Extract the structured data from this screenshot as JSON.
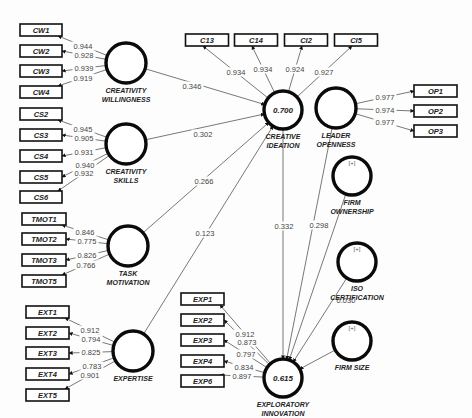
{
  "diagram": {
    "type": "PLS-SEM path model",
    "colors": {
      "stroke": "#0a0a0a",
      "edge": "#555555",
      "text": "#222222",
      "background": "#fdfdfd"
    },
    "latents": [
      {
        "id": "CW",
        "label_lines": [
          "CREATIVITY",
          "WILLINGNESS"
        ],
        "cx": 126,
        "cy": 63,
        "r": 20,
        "r2": "",
        "formative": false
      },
      {
        "id": "CS",
        "label_lines": [
          "CREATIVITY",
          "SKILLS"
        ],
        "cx": 126,
        "cy": 144,
        "r": 20,
        "r2": "",
        "formative": false
      },
      {
        "id": "TMOT",
        "label_lines": [
          "TASK",
          "MOTIVATION"
        ],
        "cx": 128,
        "cy": 246,
        "r": 20,
        "r2": "",
        "formative": false
      },
      {
        "id": "EXT",
        "label_lines": [
          "EXPERTISE"
        ],
        "cx": 133,
        "cy": 351,
        "r": 20,
        "r2": "",
        "formative": false
      },
      {
        "id": "CI",
        "label_lines": [
          "CREATIVE",
          "IDEATION"
        ],
        "cx": 283,
        "cy": 110,
        "r": 19,
        "r2": "0.700",
        "formative": false
      },
      {
        "id": "OP",
        "label_lines": [
          "LEADER",
          "OPENNESS"
        ],
        "cx": 336,
        "cy": 108,
        "r": 20,
        "r2": "",
        "formative": false
      },
      {
        "id": "EI",
        "label_lines": [
          "EXPLORATORY",
          "INNOVATION"
        ],
        "cx": 283,
        "cy": 378,
        "r": 19,
        "r2": "0.615",
        "formative": false
      },
      {
        "id": "FO",
        "label_lines": [
          "FIRM",
          "OWNERSHIP"
        ],
        "cx": 352,
        "cy": 176,
        "r": 19,
        "r2": "",
        "formative": true
      },
      {
        "id": "ISO",
        "label_lines": [
          "ISO",
          "CERTIFICATION"
        ],
        "cx": 357,
        "cy": 262,
        "r": 19,
        "r2": "",
        "formative": true
      },
      {
        "id": "FS",
        "label_lines": [
          "FIRM SIZE"
        ],
        "cx": 352,
        "cy": 341,
        "r": 19,
        "r2": "",
        "formative": true
      }
    ],
    "indicator_groups": [
      {
        "latent": "CW",
        "side": "left",
        "box_x": 20,
        "box_w": 42,
        "items": [
          {
            "label": "CW1",
            "y": 30,
            "loading": "0.944"
          },
          {
            "label": "CW2",
            "y": 51,
            "loading": "0.928"
          },
          {
            "label": "CW3",
            "y": 71,
            "loading": "0.939"
          },
          {
            "label": "CW4",
            "y": 92,
            "loading": "0.919"
          }
        ]
      },
      {
        "latent": "CS",
        "side": "left",
        "box_x": 20,
        "box_w": 42,
        "items": [
          {
            "label": "CS2",
            "y": 114,
            "loading": "0.945"
          },
          {
            "label": "CS3",
            "y": 135,
            "loading": "0.905"
          },
          {
            "label": "CS4",
            "y": 156,
            "loading": "0.931"
          },
          {
            "label": "CS5",
            "y": 177,
            "loading": "0.940"
          },
          {
            "label": "CS6",
            "y": 197,
            "loading": "0.932"
          }
        ]
      },
      {
        "latent": "TMOT",
        "side": "left",
        "box_x": 22,
        "box_w": 44,
        "items": [
          {
            "label": "TMOT1",
            "y": 219,
            "loading": "0.846"
          },
          {
            "label": "TMOT2",
            "y": 239,
            "loading": "0.775"
          },
          {
            "label": "TMOT3",
            "y": 260,
            "loading": "0.826"
          },
          {
            "label": "TMOT5",
            "y": 281,
            "loading": "0.766"
          }
        ]
      },
      {
        "latent": "EXT",
        "side": "left",
        "box_x": 26,
        "box_w": 43,
        "items": [
          {
            "label": "EXT1",
            "y": 312,
            "loading": "0.912"
          },
          {
            "label": "EXT2",
            "y": 333,
            "loading": "0.794"
          },
          {
            "label": "EXT3",
            "y": 353,
            "loading": "0.825"
          },
          {
            "label": "EXT4",
            "y": 374,
            "loading": "0.783"
          },
          {
            "label": "EXT5",
            "y": 395,
            "loading": "0.901"
          }
        ]
      },
      {
        "latent": "CI",
        "side": "top",
        "box_y": 40,
        "box_w": 43,
        "items": [
          {
            "label": "C13",
            "x": 207,
            "loading": "0.934"
          },
          {
            "label": "C14",
            "x": 256,
            "loading": "0.934"
          },
          {
            "label": "CI2",
            "x": 306,
            "loading": "0.924"
          },
          {
            "label": "CI5",
            "x": 356,
            "loading": "0.927"
          }
        ]
      },
      {
        "latent": "OP",
        "side": "right",
        "box_x": 414,
        "box_w": 43,
        "items": [
          {
            "label": "OP1",
            "y": 91,
            "loading": "0.977"
          },
          {
            "label": "OP2",
            "y": 111,
            "loading": "0.974"
          },
          {
            "label": "OP3",
            "y": 131,
            "loading": "0.977"
          }
        ]
      },
      {
        "latent": "EI",
        "side": "left",
        "box_x": 181,
        "box_w": 43,
        "items": [
          {
            "label": "EXP1",
            "y": 299,
            "loading": "0.912"
          },
          {
            "label": "EXP2",
            "y": 320,
            "loading": "0.873"
          },
          {
            "label": "EXP3",
            "y": 340,
            "loading": "0.797"
          },
          {
            "label": "EXP4",
            "y": 361,
            "loading": "0.834"
          },
          {
            "label": "EXP6",
            "y": 381,
            "loading": "0.897"
          }
        ]
      }
    ],
    "paths": [
      {
        "from": "CW",
        "to": "CI",
        "coef": "0.346",
        "lx": 192,
        "ly": 86
      },
      {
        "from": "CS",
        "to": "CI",
        "coef": "0.302",
        "lx": 203,
        "ly": 134
      },
      {
        "from": "TMOT",
        "to": "CI",
        "coef": "0.266",
        "lx": 204,
        "ly": 181
      },
      {
        "from": "EXT",
        "to": "CI",
        "coef": "0.123",
        "lx": 205,
        "ly": 233
      },
      {
        "from": "CI",
        "to": "EI",
        "coef": "0.332",
        "lx": 284,
        "ly": 226
      },
      {
        "from": "OP",
        "to": "EI",
        "coef": "0.298",
        "lx": 319,
        "ly": 225
      },
      {
        "from": "FO",
        "to": "EI",
        "coef": "0.215",
        "lx": 350,
        "ly": 258
      },
      {
        "from": "ISO",
        "to": "EI",
        "coef": "0.030",
        "lx": 346,
        "ly": 300
      },
      {
        "from": "FS",
        "to": "EI",
        "coef": "0.155",
        "lx": 357,
        "ly": 342
      }
    ]
  }
}
